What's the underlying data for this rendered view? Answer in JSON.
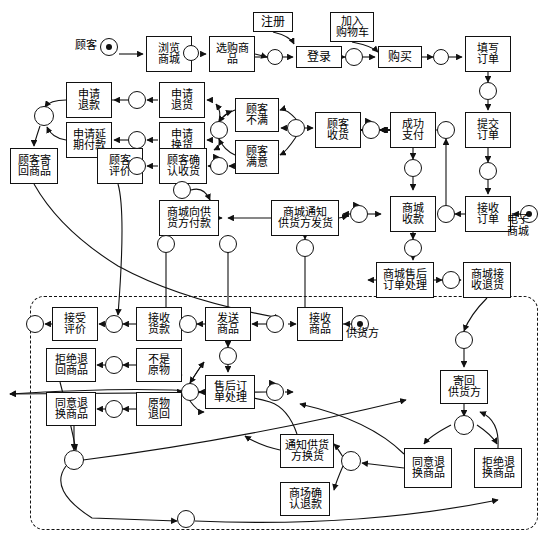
{
  "diagram": {
    "type": "petri-net",
    "width": 549,
    "height": 543,
    "stroke_color": "#111111",
    "background_color": "#ffffff"
  },
  "captions": [
    {
      "id": "cap-customer",
      "text": "顾客",
      "x": 84,
      "y": 48
    },
    {
      "id": "cap-emall",
      "text": "电子\n商城",
      "x": 516,
      "y": 222
    },
    {
      "id": "cap-supplier",
      "text": "供货方",
      "x": 360,
      "y": 336
    }
  ],
  "transitions": [
    {
      "id": "t-browse-mall",
      "label": "浏览\n商城",
      "x": 146,
      "y": 36,
      "w": 46,
      "h": 36
    },
    {
      "id": "t-select-goods",
      "label": "选购商\n品",
      "x": 209,
      "y": 36,
      "w": 46,
      "h": 36
    },
    {
      "id": "t-register",
      "label": "注册",
      "x": 253,
      "y": 12,
      "w": 40,
      "h": 20
    },
    {
      "id": "t-login",
      "label": "登录",
      "x": 296,
      "y": 46,
      "w": 46,
      "h": 22
    },
    {
      "id": "t-add-cart",
      "label": "加入\n购物车",
      "x": 330,
      "y": 12,
      "w": 44,
      "h": 30
    },
    {
      "id": "t-buy",
      "label": "购买",
      "x": 378,
      "y": 46,
      "w": 44,
      "h": 22
    },
    {
      "id": "t-fill-order",
      "label": "填写\n订单",
      "x": 465,
      "y": 36,
      "w": 46,
      "h": 36
    },
    {
      "id": "t-submit-order",
      "label": "提交\n订单",
      "x": 465,
      "y": 112,
      "w": 46,
      "h": 36
    },
    {
      "id": "t-receive-order-mall",
      "label": "接收\n订单",
      "x": 465,
      "y": 196,
      "w": 46,
      "h": 36
    },
    {
      "id": "t-apply-refund",
      "label": "申请\n退款",
      "x": 66,
      "y": 82,
      "w": 46,
      "h": 36
    },
    {
      "id": "t-apply-return",
      "label": "申请\n退货",
      "x": 159,
      "y": 82,
      "w": 46,
      "h": 36
    },
    {
      "id": "t-customer-unhappy",
      "label": "顾客\n不满",
      "x": 235,
      "y": 98,
      "w": 44,
      "h": 34
    },
    {
      "id": "t-apply-delay-pay",
      "label": "申请延\n期付款",
      "x": 66,
      "y": 122,
      "w": 46,
      "h": 36
    },
    {
      "id": "t-apply-exchange",
      "label": "申请\n换货",
      "x": 159,
      "y": 122,
      "w": 46,
      "h": 36
    },
    {
      "id": "t-customer-happy",
      "label": "顾客\n满意",
      "x": 235,
      "y": 140,
      "w": 44,
      "h": 34
    },
    {
      "id": "t-customer-send-back",
      "label": "顾客寄\n回商品",
      "x": 10,
      "y": 148,
      "w": 48,
      "h": 36
    },
    {
      "id": "t-customer-review",
      "label": "顾客\n评价",
      "x": 97,
      "y": 148,
      "w": 46,
      "h": 36
    },
    {
      "id": "t-confirm-receipt",
      "label": "顾客确\n认收货",
      "x": 159,
      "y": 148,
      "w": 48,
      "h": 36
    },
    {
      "id": "t-customer-receive",
      "label": "顾客\n收货",
      "x": 315,
      "y": 112,
      "w": 46,
      "h": 36
    },
    {
      "id": "t-pay-success",
      "label": "成功\n支付",
      "x": 390,
      "y": 112,
      "w": 46,
      "h": 36
    },
    {
      "id": "t-mall-pay-supplier",
      "label": "商城向供\n货方付款",
      "x": 159,
      "y": 200,
      "w": 60,
      "h": 36
    },
    {
      "id": "t-mall-notify-ship",
      "label": "商城通知\n供货方发货",
      "x": 271,
      "y": 200,
      "w": 68,
      "h": 36
    },
    {
      "id": "t-mall-collect",
      "label": "商城\n收款",
      "x": 390,
      "y": 196,
      "w": 46,
      "h": 36
    },
    {
      "id": "t-mall-aftersale",
      "label": "商城售后\n订单处理",
      "x": 376,
      "y": 262,
      "w": 58,
      "h": 36
    },
    {
      "id": "t-mall-accept-return",
      "label": "商城接\n收退货",
      "x": 463,
      "y": 262,
      "w": 48,
      "h": 36
    },
    {
      "id": "t-accept-review",
      "label": "接受\n评价",
      "x": 52,
      "y": 307,
      "w": 46,
      "h": 34
    },
    {
      "id": "t-receive-payment",
      "label": "接收\n货款",
      "x": 136,
      "y": 307,
      "w": 46,
      "h": 34
    },
    {
      "id": "t-send-goods",
      "label": "发送\n商品",
      "x": 205,
      "y": 307,
      "w": 46,
      "h": 34
    },
    {
      "id": "t-receive-order-sup",
      "label": "接收\n商品",
      "x": 297,
      "y": 307,
      "w": 46,
      "h": 34
    },
    {
      "id": "t-refuse-return-item",
      "label": "拒绝退\n回商品",
      "x": 46,
      "y": 348,
      "w": 50,
      "h": 34
    },
    {
      "id": "t-not-original",
      "label": "不是\n原物",
      "x": 136,
      "y": 348,
      "w": 46,
      "h": 34
    },
    {
      "id": "t-aftersale-process",
      "label": "售后订\n单处理",
      "x": 205,
      "y": 375,
      "w": 50,
      "h": 34
    },
    {
      "id": "t-agree-exchange",
      "label": "同意退\n换商品",
      "x": 46,
      "y": 392,
      "w": 50,
      "h": 34
    },
    {
      "id": "t-original-returned",
      "label": "原物\n退回",
      "x": 136,
      "y": 392,
      "w": 46,
      "h": 34
    },
    {
      "id": "t-send-back-supplier",
      "label": "寄回\n供货方",
      "x": 440,
      "y": 370,
      "w": 48,
      "h": 34
    },
    {
      "id": "t-notify-exchange",
      "label": "通知供货\n方换货",
      "x": 280,
      "y": 434,
      "w": 54,
      "h": 34
    },
    {
      "id": "t-mall-confirm-refund",
      "label": "商场确\n认退款",
      "x": 280,
      "y": 482,
      "w": 50,
      "h": 34
    },
    {
      "id": "t-sup-agree-exchange",
      "label": "同意退\n换商品",
      "x": 404,
      "y": 448,
      "w": 48,
      "h": 40
    },
    {
      "id": "t-sup-refuse-exchange",
      "label": "拒绝退\n换商品",
      "x": 474,
      "y": 448,
      "w": 48,
      "h": 40
    }
  ],
  "places": [
    {
      "id": "p-customer",
      "x": 109,
      "y": 47,
      "r": 9,
      "token": true
    },
    {
      "id": "p1",
      "x": 191,
      "y": 53,
      "r": 8,
      "token": false
    },
    {
      "id": "p2",
      "x": 275,
      "y": 57,
      "r": 8,
      "token": false
    },
    {
      "id": "p3",
      "x": 354,
      "y": 57,
      "r": 9,
      "token": false
    },
    {
      "id": "p4",
      "x": 441,
      "y": 57,
      "r": 8,
      "token": false
    },
    {
      "id": "p5",
      "x": 488,
      "y": 91,
      "r": 9,
      "token": false
    },
    {
      "id": "p6",
      "x": 488,
      "y": 171,
      "r": 9,
      "token": false
    },
    {
      "id": "p-emall-token",
      "x": 529,
      "y": 214,
      "r": 9,
      "token": true
    },
    {
      "id": "p7",
      "x": 446,
      "y": 214,
      "r": 9,
      "token": false
    },
    {
      "id": "p8",
      "x": 446,
      "y": 130,
      "r": 9,
      "token": false
    },
    {
      "id": "p9",
      "x": 371,
      "y": 130,
      "r": 9,
      "token": false
    },
    {
      "id": "p10",
      "x": 296,
      "y": 128,
      "r": 9,
      "token": false
    },
    {
      "id": "p11",
      "x": 219,
      "y": 130,
      "r": 9,
      "token": false
    },
    {
      "id": "p12",
      "x": 137,
      "y": 100,
      "r": 9,
      "token": false
    },
    {
      "id": "p13",
      "x": 137,
      "y": 140,
      "r": 9,
      "token": false
    },
    {
      "id": "p14",
      "x": 137,
      "y": 166,
      "r": 9,
      "token": false
    },
    {
      "id": "p15",
      "x": 219,
      "y": 166,
      "r": 9,
      "token": false
    },
    {
      "id": "p16",
      "x": 44,
      "y": 116,
      "r": 10,
      "token": false
    },
    {
      "id": "p17",
      "x": 182,
      "y": 190,
      "r": 9,
      "token": false
    },
    {
      "id": "p18",
      "x": 413,
      "y": 168,
      "r": 9,
      "token": false
    },
    {
      "id": "p19",
      "x": 359,
      "y": 214,
      "r": 9,
      "token": false
    },
    {
      "id": "p20",
      "x": 413,
      "y": 248,
      "r": 9,
      "token": false
    },
    {
      "id": "p21",
      "x": 451,
      "y": 280,
      "r": 9,
      "token": false
    },
    {
      "id": "p22",
      "x": 166,
      "y": 244,
      "r": 9,
      "token": false
    },
    {
      "id": "p23",
      "x": 228,
      "y": 244,
      "r": 9,
      "token": false
    },
    {
      "id": "p24",
      "x": 305,
      "y": 248,
      "r": 9,
      "token": false
    },
    {
      "id": "p25",
      "x": 35,
      "y": 324,
      "r": 9,
      "token": false
    },
    {
      "id": "p26",
      "x": 114,
      "y": 324,
      "r": 9,
      "token": false
    },
    {
      "id": "p27",
      "x": 188,
      "y": 324,
      "r": 9,
      "token": false
    },
    {
      "id": "p28",
      "x": 275,
      "y": 324,
      "r": 9,
      "token": false
    },
    {
      "id": "p-supplier",
      "x": 360,
      "y": 324,
      "r": 9,
      "token": true
    },
    {
      "id": "p29",
      "x": 228,
      "y": 356,
      "r": 9,
      "token": false
    },
    {
      "id": "p30",
      "x": 114,
      "y": 365,
      "r": 9,
      "token": false
    },
    {
      "id": "p31",
      "x": 190,
      "y": 392,
      "r": 9,
      "token": false
    },
    {
      "id": "p32",
      "x": 114,
      "y": 409,
      "r": 9,
      "token": false
    },
    {
      "id": "p33",
      "x": 275,
      "y": 392,
      "r": 9,
      "token": false
    },
    {
      "id": "p34",
      "x": 74,
      "y": 460,
      "r": 10,
      "token": false
    },
    {
      "id": "p35",
      "x": 464,
      "y": 340,
      "r": 9,
      "token": false
    },
    {
      "id": "p36",
      "x": 464,
      "y": 425,
      "r": 10,
      "token": false
    },
    {
      "id": "p37",
      "x": 351,
      "y": 461,
      "r": 10,
      "token": false
    },
    {
      "id": "p38",
      "x": 186,
      "y": 519,
      "r": 9,
      "token": false
    }
  ],
  "subnet": {
    "id": "supplier-subnet",
    "x": 30,
    "y": 296,
    "w": 508,
    "h": 234,
    "style": "dashed"
  }
}
